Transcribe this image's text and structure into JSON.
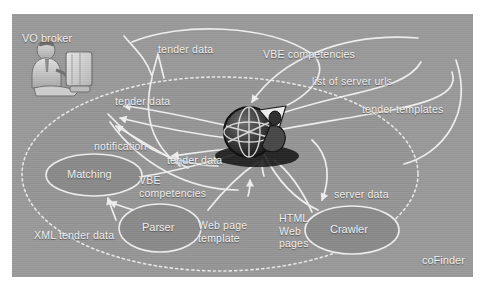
{
  "figure": {
    "system_label": "coFinder",
    "actor_label": "VO broker",
    "background_color": "#9a9a9a",
    "line_color": "#f0f0f0",
    "text_color": "#f3f3f3"
  },
  "nodes": [
    {
      "id": "matching",
      "label": "Matching",
      "cx": 82,
      "cy": 161,
      "rx": 48,
      "ry": 21
    },
    {
      "id": "parser",
      "label": "Parser",
      "cx": 148,
      "cy": 214,
      "rx": 41,
      "ry": 24
    },
    {
      "id": "crawler",
      "label": "Crawler",
      "cx": 340,
      "cy": 216,
      "rx": 47,
      "ry": 24
    }
  ],
  "actors": [
    {
      "id": "vo-broker",
      "name": "person-at-computer-icon"
    },
    {
      "id": "web-sphere",
      "name": "globe-network-icon"
    }
  ],
  "flow_labels": [
    {
      "id": "f1",
      "text": "tender data",
      "x": 146,
      "y": 29
    },
    {
      "id": "f2",
      "text": "VBE competencies",
      "x": 251,
      "y": 34
    },
    {
      "id": "f3",
      "text": "list of server urls",
      "x": 300,
      "y": 61
    },
    {
      "id": "f4",
      "text": "tender data",
      "x": 103,
      "y": 81
    },
    {
      "id": "f5",
      "text": "tender templates",
      "x": 350,
      "y": 89
    },
    {
      "id": "f6",
      "text": "notification",
      "x": 82,
      "y": 126
    },
    {
      "id": "f7",
      "text": "tender data",
      "x": 155,
      "y": 140
    },
    {
      "id": "f8",
      "text": "VBE\ncompetencies",
      "x": 127,
      "y": 160
    },
    {
      "id": "f9",
      "text": "server data",
      "x": 322,
      "y": 174
    },
    {
      "id": "f10",
      "text": "XML tender data",
      "x": 22,
      "y": 215
    },
    {
      "id": "f11",
      "text": "Web page\ntemplate",
      "x": 186,
      "y": 205
    },
    {
      "id": "f12",
      "text": "HTML\nWeb\npages",
      "x": 267,
      "y": 198
    }
  ]
}
